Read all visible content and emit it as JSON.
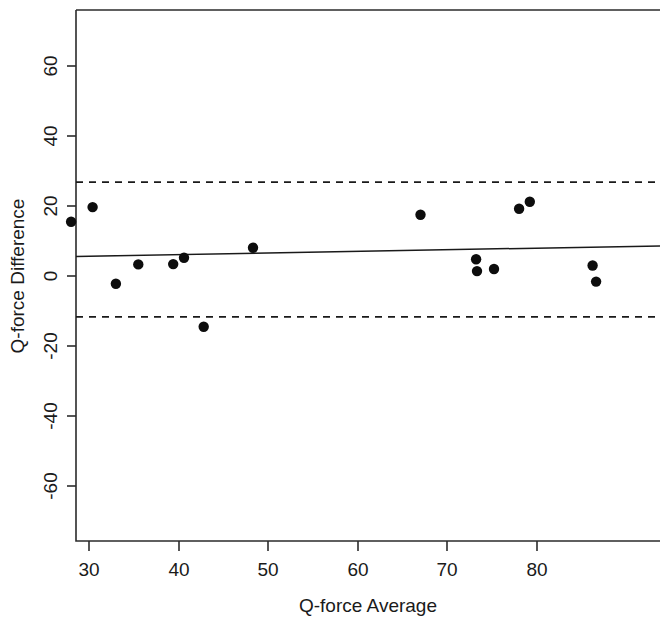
{
  "chart_data": {
    "type": "scatter",
    "title": "",
    "xlabel": "Q-force Average",
    "ylabel": "Q-force Difference",
    "xlim": [
      27.5,
      88.5
    ],
    "ylim": [
      -72,
      72
    ],
    "xticks": [
      30,
      40,
      50,
      60,
      70,
      80
    ],
    "yticks": [
      -60,
      -40,
      -20,
      0,
      20,
      40,
      60
    ],
    "xtick_labels": [
      "30",
      "40",
      "50",
      "60",
      "70",
      "80"
    ],
    "ytick_labels": [
      "-60",
      "-40",
      "-20",
      "0",
      "20",
      "40",
      "60"
    ],
    "grid": false,
    "legend": false,
    "points": [
      {
        "x": 28.0,
        "y": 15.5
      },
      {
        "x": 30.4,
        "y": 19.7
      },
      {
        "x": 33.0,
        "y": -2.2
      },
      {
        "x": 35.5,
        "y": 3.3
      },
      {
        "x": 39.4,
        "y": 3.4
      },
      {
        "x": 40.6,
        "y": 5.2
      },
      {
        "x": 42.8,
        "y": -14.5
      },
      {
        "x": 48.3,
        "y": 8.1
      },
      {
        "x": 67.0,
        "y": 17.5
      },
      {
        "x": 73.2,
        "y": 4.8
      },
      {
        "x": 73.3,
        "y": 1.4
      },
      {
        "x": 75.2,
        "y": 2.0
      },
      {
        "x": 78.0,
        "y": 19.2
      },
      {
        "x": 79.2,
        "y": 21.2
      },
      {
        "x": 86.2,
        "y": 3.0
      },
      {
        "x": 86.6,
        "y": -1.6
      }
    ],
    "regression_line": {
      "style": "solid",
      "x_start": 27.5,
      "y_start": 5.6,
      "x_end": 88.5,
      "y_end": 8.6
    },
    "limits_of_agreement": {
      "style": "dashed",
      "upper": 26.8,
      "lower": -11.7
    },
    "point_marker": "filled-circle",
    "point_radius_px": 5.2
  }
}
